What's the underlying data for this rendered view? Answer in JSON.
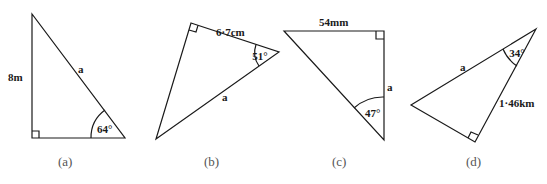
{
  "figures": [
    {
      "caption": "(a)",
      "labels": {
        "side_vertical": "8m",
        "hypotenuse": "a",
        "angle": "64°"
      }
    },
    {
      "caption": "(b)",
      "labels": {
        "side_top": "6·7cm",
        "hypotenuse": "a",
        "angle": "51°"
      }
    },
    {
      "caption": "(c)",
      "labels": {
        "side_top": "54mm",
        "side_vertical": "a",
        "angle": "47°"
      }
    },
    {
      "caption": "(d)",
      "labels": {
        "hypotenuse": "a",
        "side_right": "1·46km",
        "angle": "34°"
      }
    }
  ],
  "colors": {
    "stroke": "#1a1a1a",
    "caption": "#555555",
    "background": "#ffffff"
  }
}
